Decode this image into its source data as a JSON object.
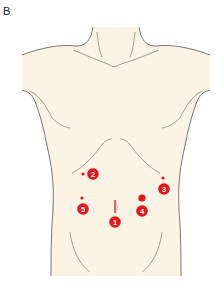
{
  "figure": {
    "panel_label": "B",
    "colors": {
      "skin": "#fbf3e3",
      "outline": "#555555",
      "marker": "#e8141b",
      "marker_text": "#ffffff",
      "background": "#ffffff"
    }
  },
  "ports": [
    {
      "number": "1",
      "label": "1",
      "location": "umbilicus",
      "incision": "vertical",
      "badge": {
        "x": 115,
        "y": 222
      },
      "site": {
        "x": 115,
        "y": 206
      }
    },
    {
      "number": "2",
      "label": "2",
      "location": "right subcostal",
      "badge": {
        "x": 93,
        "y": 174
      },
      "site": {
        "x": 83,
        "y": 174
      }
    },
    {
      "number": "3",
      "label": "3",
      "location": "left lateral subcostal",
      "badge": {
        "x": 164,
        "y": 189
      },
      "site": {
        "x": 163,
        "y": 178
      }
    },
    {
      "number": "4",
      "label": "4",
      "location": "left mid-abdomen",
      "badge": {
        "x": 142,
        "y": 211
      },
      "site": {
        "x": 142,
        "y": 198
      }
    },
    {
      "number": "5",
      "label": "5",
      "location": "right mid-abdomen",
      "badge": {
        "x": 83,
        "y": 209
      },
      "site": {
        "x": 82,
        "y": 198
      }
    }
  ]
}
